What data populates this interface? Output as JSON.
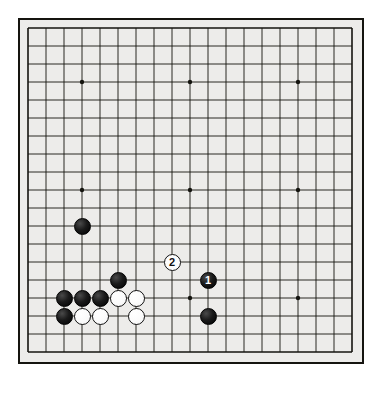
{
  "figure": {
    "caption": "问题图 4",
    "type": "go-board-diagram"
  },
  "board": {
    "size": 19,
    "origin_x": 10,
    "origin_y": 10,
    "spacing": 18,
    "line_color": "#15140f",
    "background_color": "#edecea",
    "border_color": "#15140f",
    "star_points": [
      [
        3,
        3
      ],
      [
        9,
        3
      ],
      [
        15,
        3
      ],
      [
        3,
        9
      ],
      [
        9,
        9
      ],
      [
        15,
        9
      ],
      [
        3,
        15
      ],
      [
        9,
        15
      ],
      [
        15,
        15
      ]
    ]
  },
  "stones": [
    {
      "color": "black",
      "col": 3,
      "row": 11,
      "label": ""
    },
    {
      "color": "black",
      "col": 5,
      "row": 14,
      "label": ""
    },
    {
      "color": "black",
      "col": 2,
      "row": 15,
      "label": ""
    },
    {
      "color": "black",
      "col": 3,
      "row": 15,
      "label": ""
    },
    {
      "color": "black",
      "col": 4,
      "row": 15,
      "label": ""
    },
    {
      "color": "white",
      "col": 5,
      "row": 15,
      "label": ""
    },
    {
      "color": "white",
      "col": 6,
      "row": 15,
      "label": ""
    },
    {
      "color": "black",
      "col": 2,
      "row": 16,
      "label": ""
    },
    {
      "color": "white",
      "col": 3,
      "row": 16,
      "label": ""
    },
    {
      "color": "white",
      "col": 4,
      "row": 16,
      "label": ""
    },
    {
      "color": "white",
      "col": 6,
      "row": 16,
      "label": ""
    },
    {
      "color": "black",
      "col": 10,
      "row": 14,
      "label": "1"
    },
    {
      "color": "white",
      "col": 8,
      "row": 13,
      "label": "2"
    },
    {
      "color": "black",
      "col": 10,
      "row": 16,
      "label": ""
    }
  ]
}
